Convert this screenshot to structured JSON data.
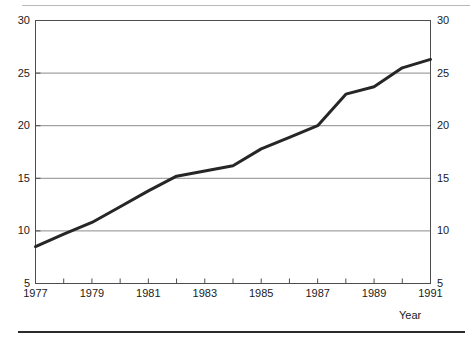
{
  "chart_data": {
    "type": "line",
    "title": "",
    "subtitle": "",
    "xlabel": "Year",
    "ylabel": "",
    "x": [
      1977,
      1978,
      1979,
      1980,
      1981,
      1982,
      1983,
      1984,
      1985,
      1986,
      1987,
      1988,
      1989,
      1990,
      1991
    ],
    "series": [
      {
        "name": "",
        "values": [
          8.5,
          9.7,
          10.8,
          12.3,
          13.8,
          15.2,
          15.7,
          16.2,
          17.8,
          18.9,
          20.0,
          23.0,
          23.7,
          25.5,
          26.3
        ]
      }
    ],
    "xlim": [
      1977,
      1991
    ],
    "ylim": [
      5,
      30
    ],
    "y_ticks": [
      5,
      10,
      15,
      20,
      25,
      30
    ],
    "y_tick_labels": [
      "5",
      "10",
      "15",
      "20",
      "25",
      "30"
    ],
    "y_axis_right_labels": [
      "5",
      "10",
      "15",
      "20",
      "25",
      "30"
    ],
    "x_ticks": [
      1977,
      1978,
      1979,
      1980,
      1981,
      1982,
      1983,
      1984,
      1985,
      1986,
      1987,
      1988,
      1989,
      1990,
      1991
    ],
    "x_tick_labels": [
      "1977",
      "",
      "1979",
      "",
      "1981",
      "",
      "1983",
      "",
      "1985",
      "",
      "1987",
      "",
      "1989",
      "",
      "1991"
    ],
    "grid": true,
    "gridlines_y": [
      10,
      15,
      20,
      25
    ],
    "legend": null,
    "legend_position": "none",
    "line_color": "#262626",
    "grid_color": "#8c8c8c",
    "axis_color": "#4d4d4d",
    "background_color": "#ffffff",
    "annotations": []
  },
  "decorations": {
    "top_rule_color": "#b9b9b9",
    "bottom_rule_color": "#2b2b2b"
  }
}
